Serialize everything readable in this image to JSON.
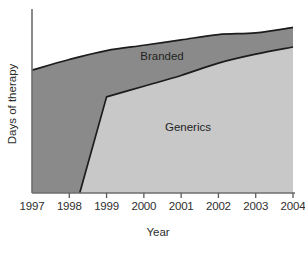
{
  "chart_data": {
    "type": "area",
    "stacked": true,
    "title": "",
    "xlabel": "Year",
    "ylabel": "Days of therapy",
    "grid": false,
    "legend_position": "inline-labels",
    "categories": [
      "1997",
      "1998",
      "1999",
      "2000",
      "2001",
      "2002",
      "2003",
      "2004"
    ],
    "x": [
      1997,
      1998,
      1999,
      2000,
      2001,
      2002,
      2003,
      2004
    ],
    "ylim": [
      0,
      100
    ],
    "y_tick_labels": [],
    "series": [
      {
        "name": "Generics",
        "color": "#c8c8c8",
        "values": [
          0,
          0,
          54,
          60,
          66,
          73,
          78,
          82
        ]
      },
      {
        "name": "Branded",
        "color": "#8a8a8a",
        "values": [
          69,
          75,
          26,
          23,
          20,
          16,
          12,
          11
        ]
      }
    ],
    "totals": [
      69,
      75,
      80,
      83,
      86,
      89,
      90,
      93
    ],
    "annotations": [
      {
        "text": "Branded",
        "x": 2000.0,
        "y": 83
      },
      {
        "text": "Generics",
        "x": 2000.8,
        "y": 40
      }
    ]
  },
  "axis": {
    "x_title": "Year",
    "y_title": "Days of therapy",
    "x_ticks": [
      "1997",
      "1998",
      "1999",
      "2000",
      "2001",
      "2002",
      "2003",
      "2004"
    ]
  },
  "labels": {
    "branded": "Branded",
    "generics": "Generics"
  },
  "colors": {
    "branded_fill": "#8a8a8a",
    "generics_fill": "#c8c8c8",
    "outline": "#1c1c1c",
    "axis": "#6e6e6e",
    "background": "#ffffff"
  }
}
